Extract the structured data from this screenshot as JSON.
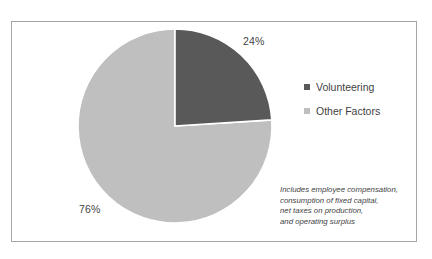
{
  "figure": {
    "border_color": "#a6a6a6",
    "background": "#ffffff"
  },
  "legend": {
    "position": "right",
    "items": [
      {
        "label": "Volunteering",
        "color": "#595959",
        "marker": "square"
      },
      {
        "label": "Other Factors",
        "color": "#bfbfbf",
        "marker": "square"
      }
    ]
  },
  "labels": {
    "volunteering_pct": "24%",
    "other_pct": "76%"
  },
  "footnote": {
    "lines": [
      "Includes employee compensation,",
      "consumption of fixed capital,",
      "net taxes on production,",
      "and operating surplus"
    ]
  },
  "chart_data": {
    "type": "pie",
    "title": "",
    "categories": [
      "Volunteering",
      "Other Factors"
    ],
    "values": [
      24,
      76
    ],
    "value_labels": [
      "24%",
      "76%"
    ],
    "colors": [
      "#595959",
      "#bfbfbf"
    ],
    "units": "percent",
    "start_angle_deg": 0,
    "direction": "clockwise",
    "legend_position": "right",
    "grid": false,
    "annotations": [
      "Includes employee compensation, consumption of fixed capital, net taxes on production, and operating surplus"
    ]
  }
}
